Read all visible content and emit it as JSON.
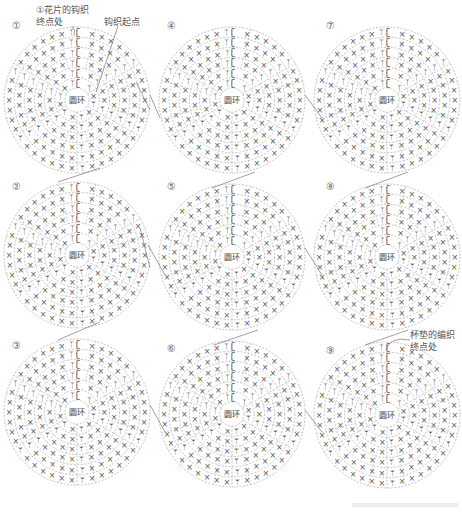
{
  "annotations": {
    "start_end_line1": "①花片的钩织",
    "start_end_line2": "终点处",
    "crochet_start": "钩织起点",
    "cup_end_line1": "杯垫的编织",
    "cup_end_line2": "终点处"
  },
  "center_label": "圆环",
  "symbols": {
    "sc": "×",
    "inc": "ᛉ",
    "dec": "ᛘ",
    "chain": "ʗ"
  },
  "colors": {
    "line": "#9a9a9a",
    "stitch": "#555555",
    "arrow": "#777777"
  },
  "motifs": [
    {
      "number": "①",
      "cx": 77,
      "cy": 100
    },
    {
      "number": "②",
      "cx": 77,
      "cy": 255
    },
    {
      "number": "③",
      "cx": 77,
      "cy": 412
    },
    {
      "number": "④",
      "cx": 232,
      "cy": 100
    },
    {
      "number": "⑤",
      "cx": 232,
      "cy": 257
    },
    {
      "number": "⑥",
      "cx": 232,
      "cy": 414
    },
    {
      "number": "⑦",
      "cx": 387,
      "cy": 100
    },
    {
      "number": "⑧",
      "cx": 387,
      "cy": 257
    },
    {
      "number": "⑨",
      "cx": 387,
      "cy": 415
    }
  ],
  "rows": 6,
  "radius": 73
}
